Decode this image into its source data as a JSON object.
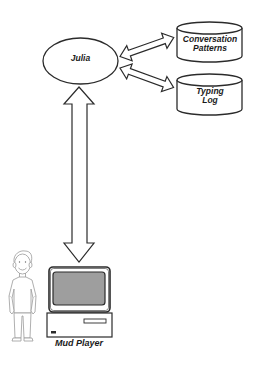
{
  "diagram": {
    "title": "",
    "nodes": {
      "julia": {
        "label": "Julia",
        "shape": "ellipse"
      },
      "conversation_patterns": {
        "label_line1": "Conversation",
        "label_line2": "Patterns",
        "shape": "cylinder"
      },
      "typing_log": {
        "label_line1": "Typing",
        "label_line2": "Log",
        "shape": "cylinder"
      },
      "mud_player": {
        "label": "Mud Player",
        "shape": "person-with-computer"
      }
    },
    "edges": [
      {
        "from": "julia",
        "to": "conversation_patterns",
        "type": "bidirectional-arrow"
      },
      {
        "from": "julia",
        "to": "typing_log",
        "type": "bidirectional-arrow"
      },
      {
        "from": "julia",
        "to": "mud_player",
        "type": "bidirectional-arrow"
      }
    ],
    "colors": {
      "stroke": "#2b2b2b",
      "screen": "#9e9e9e",
      "person_line": "#9a9a9a",
      "background": "#ffffff"
    }
  }
}
